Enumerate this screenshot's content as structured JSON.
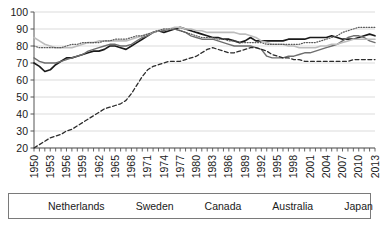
{
  "chart_data": {
    "type": "line",
    "title": "",
    "xlabel": "",
    "ylabel": "",
    "xlim": [
      1950,
      2013
    ],
    "ylim": [
      20,
      100
    ],
    "yticks": [
      20,
      30,
      40,
      50,
      60,
      70,
      80,
      90,
      100
    ],
    "xticks": [
      1950,
      1953,
      1956,
      1959,
      1962,
      1965,
      1968,
      1971,
      1974,
      1977,
      1980,
      1983,
      1986,
      1989,
      1992,
      1995,
      1998,
      2001,
      2004,
      2007,
      2010,
      2013
    ],
    "grid": "horizontal",
    "legend_position": "bottom",
    "x": [
      1950,
      1951,
      1952,
      1953,
      1954,
      1955,
      1956,
      1957,
      1958,
      1959,
      1960,
      1961,
      1962,
      1963,
      1964,
      1965,
      1966,
      1967,
      1968,
      1969,
      1970,
      1971,
      1972,
      1973,
      1974,
      1975,
      1976,
      1977,
      1978,
      1979,
      1980,
      1981,
      1982,
      1983,
      1984,
      1985,
      1986,
      1987,
      1988,
      1989,
      1990,
      1991,
      1992,
      1993,
      1994,
      1995,
      1996,
      1997,
      1998,
      1999,
      2000,
      2001,
      2002,
      2003,
      2004,
      2005,
      2006,
      2007,
      2008,
      2009,
      2010,
      2011,
      2012,
      2013
    ],
    "series": [
      {
        "name": "Netherlands",
        "color": "#1a1a1a",
        "style": "solid",
        "width": 1.7,
        "values": [
          70,
          68,
          65,
          66,
          69,
          71,
          73,
          73,
          74,
          75,
          76,
          77,
          77,
          78,
          80,
          80,
          79,
          78,
          80,
          82,
          84,
          86,
          88,
          89,
          88,
          89,
          90,
          91,
          90,
          89,
          88,
          87,
          86,
          85,
          85,
          84,
          84,
          83,
          82,
          83,
          85,
          83,
          83,
          83,
          83,
          83,
          83,
          84,
          84,
          84,
          84,
          85,
          85,
          85,
          85,
          86,
          85,
          84,
          84,
          84,
          85,
          86,
          87,
          86
        ]
      },
      {
        "name": "Sweden",
        "color": "#6e6e6e",
        "style": "solid",
        "width": 1.4,
        "values": [
          73,
          71,
          70,
          70,
          70,
          71,
          72,
          73,
          74,
          75,
          77,
          78,
          79,
          80,
          81,
          81,
          80,
          80,
          81,
          83,
          85,
          86,
          88,
          89,
          89,
          90,
          90,
          89,
          88,
          86,
          85,
          84,
          84,
          84,
          83,
          82,
          81,
          80,
          80,
          80,
          80,
          79,
          78,
          74,
          73,
          73,
          73,
          74,
          74,
          75,
          76,
          76,
          77,
          78,
          79,
          80,
          81,
          83,
          85,
          86,
          86,
          85,
          83,
          82
        ]
      },
      {
        "name": "Canada",
        "color": "#bdbdbd",
        "style": "solid",
        "width": 1.6,
        "values": [
          85,
          83,
          81,
          80,
          79,
          79,
          79,
          79,
          80,
          81,
          82,
          82,
          83,
          83,
          83,
          83,
          83,
          83,
          84,
          85,
          86,
          87,
          88,
          89,
          90,
          90,
          91,
          91,
          90,
          90,
          89,
          89,
          88,
          88,
          88,
          88,
          88,
          88,
          87,
          87,
          86,
          85,
          83,
          82,
          81,
          81,
          81,
          80,
          80,
          79,
          79,
          79,
          79,
          80,
          80,
          81,
          81,
          82,
          83,
          84,
          84,
          84,
          84,
          84
        ]
      },
      {
        "name": "Australia",
        "color": "#5a5a5a",
        "style": "dotted",
        "width": 1.2,
        "values": [
          80,
          79,
          79,
          79,
          79,
          79,
          80,
          81,
          81,
          82,
          82,
          82,
          82,
          83,
          83,
          84,
          84,
          84,
          85,
          86,
          86,
          87,
          88,
          89,
          90,
          90,
          90,
          89,
          88,
          87,
          86,
          85,
          85,
          85,
          84,
          84,
          83,
          83,
          82,
          82,
          82,
          82,
          82,
          81,
          81,
          81,
          81,
          81,
          81,
          81,
          82,
          82,
          82,
          83,
          84,
          85,
          86,
          88,
          89,
          90,
          91,
          91,
          91,
          91
        ]
      },
      {
        "name": "Japan",
        "color": "#2b2b2b",
        "style": "dashed",
        "width": 1.3,
        "values": [
          20,
          22,
          24,
          26,
          27,
          28,
          30,
          31,
          33,
          35,
          37,
          39,
          41,
          43,
          44,
          45,
          46,
          48,
          52,
          57,
          62,
          66,
          68,
          69,
          70,
          71,
          71,
          71,
          72,
          73,
          74,
          76,
          78,
          79,
          78,
          77,
          76,
          76,
          77,
          78,
          79,
          79,
          78,
          77,
          75,
          74,
          73,
          73,
          72,
          72,
          71,
          71,
          71,
          71,
          71,
          71,
          71,
          71,
          71,
          72,
          72,
          72,
          72,
          72
        ]
      }
    ]
  },
  "legend": {
    "items": [
      {
        "label": "Netherlands"
      },
      {
        "label": "Sweden"
      },
      {
        "label": "Canada"
      },
      {
        "label": "Australia"
      },
      {
        "label": "Japan"
      }
    ]
  }
}
